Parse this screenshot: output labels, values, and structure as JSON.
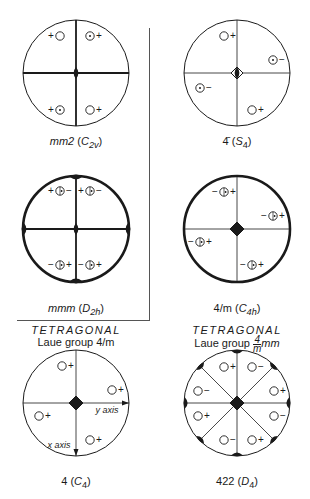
{
  "figure": {
    "panels": [
      {
        "id": "mm2",
        "symbol": "mm2",
        "schoenflies": "C",
        "schoenflies_sub": "2v",
        "center": [
          76,
          73
        ],
        "radius": 53,
        "thick_border": false,
        "mirrors": [
          "horizontal",
          "vertical"
        ],
        "axis_symbol": "2-fold (lens)",
        "poles": [
          {
            "label_left": "+",
            "marker": "open",
            "label_right": "",
            "x": 60,
            "y": 36
          },
          {
            "label_left": "",
            "marker": "dot",
            "label_right": "+",
            "x": 90,
            "y": 36
          },
          {
            "label_left": "+",
            "marker": "dot",
            "label_right": "",
            "x": 60,
            "y": 110
          },
          {
            "label_left": "",
            "marker": "open",
            "label_right": "+",
            "x": 90,
            "y": 110
          }
        ]
      },
      {
        "id": "s4",
        "symbol": "4̄",
        "schoenflies": "S",
        "schoenflies_sub": "4",
        "center": [
          237,
          73
        ],
        "radius": 53,
        "thick_border": false,
        "mirrors": [],
        "axis_symbol": "4-bar (diamond with lens)",
        "poles": [
          {
            "label_left": "",
            "marker": "open",
            "label_right": "+",
            "x": 224,
            "y": 36
          },
          {
            "label_left": "",
            "marker": "dot",
            "label_right": "−",
            "x": 273,
            "y": 60
          },
          {
            "label_left": "",
            "marker": "dot",
            "label_right": "−",
            "x": 200,
            "y": 88
          },
          {
            "label_left": "",
            "marker": "open",
            "label_right": "+",
            "x": 252,
            "y": 110
          }
        ]
      },
      {
        "id": "mmm",
        "symbol": "mmm",
        "schoenflies": "D",
        "schoenflies_sub": "2h",
        "center": [
          76,
          229
        ],
        "radius": 53,
        "thick_border": true,
        "mirrors": [
          "horizontal",
          "vertical",
          "equatorial"
        ],
        "axis_symbol": "2-fold (lens)",
        "poles": [
          {
            "label_left": "+",
            "marker": "split",
            "label_right": "−",
            "x": 60,
            "y": 191
          },
          {
            "label_left": "+",
            "marker": "split",
            "label_right": "−",
            "x": 90,
            "y": 191
          },
          {
            "label_left": "−",
            "marker": "split",
            "label_right": "+",
            "x": 60,
            "y": 265
          },
          {
            "label_left": "−",
            "marker": "split",
            "label_right": "+",
            "x": 90,
            "y": 265
          }
        ]
      },
      {
        "id": "4m",
        "symbol": "4/m",
        "schoenflies": "C",
        "schoenflies_sub": "4h",
        "center": [
          237,
          229
        ],
        "radius": 53,
        "thick_border": true,
        "mirrors": [
          "equatorial"
        ],
        "axis_symbol": "4-fold (diamond)",
        "poles": [
          {
            "label_left": "−",
            "marker": "split",
            "label_right": "+",
            "x": 224,
            "y": 192
          },
          {
            "label_left": "−",
            "marker": "split",
            "label_right": "+",
            "x": 273,
            "y": 216
          },
          {
            "label_left": "−",
            "marker": "split",
            "label_right": "+",
            "x": 200,
            "y": 242
          },
          {
            "label_left": "−",
            "marker": "split",
            "label_right": "+",
            "x": 252,
            "y": 265
          }
        ]
      },
      {
        "id": "c4",
        "symbol": "4",
        "schoenflies": "C",
        "schoenflies_sub": "4",
        "center": [
          76,
          403
        ],
        "radius": 53,
        "thick_border": false,
        "mirrors": [],
        "axis_symbol": "4-fold (diamond)",
        "axes": {
          "x_label": "x axis",
          "y_label": "y axis"
        },
        "poles": [
          {
            "label_left": "",
            "marker": "open",
            "label_right": "+",
            "x": 62,
            "y": 366
          },
          {
            "label_left": "",
            "marker": "open",
            "label_right": "+",
            "x": 112,
            "y": 390
          },
          {
            "label_left": "",
            "marker": "open",
            "label_right": "+",
            "x": 39,
            "y": 416
          },
          {
            "label_left": "",
            "marker": "open",
            "label_right": "+",
            "x": 90,
            "y": 440
          }
        ]
      },
      {
        "id": "422",
        "symbol": "422",
        "schoenflies": "D",
        "schoenflies_sub": "4",
        "center": [
          237,
          403
        ],
        "radius": 53,
        "thick_border": false,
        "mirrors": [],
        "axis_symbol": "4-fold (diamond) with 2-fold edges",
        "poles": [
          {
            "label_left": "",
            "marker": "open",
            "label_right": "+",
            "x": 224,
            "y": 367
          },
          {
            "label_left": "",
            "marker": "open",
            "label_right": "−",
            "x": 252,
            "y": 367
          },
          {
            "label_left": "",
            "marker": "open",
            "label_right": "−",
            "x": 198,
            "y": 391
          },
          {
            "label_left": "",
            "marker": "open",
            "label_right": "+",
            "x": 274,
            "y": 391
          },
          {
            "label_left": "",
            "marker": "open",
            "label_right": "+",
            "x": 198,
            "y": 416
          },
          {
            "label_left": "",
            "marker": "open",
            "label_right": "−",
            "x": 274,
            "y": 416
          },
          {
            "label_left": "",
            "marker": "open",
            "label_right": "−",
            "x": 224,
            "y": 440
          },
          {
            "label_left": "",
            "marker": "open",
            "label_right": "+",
            "x": 252,
            "y": 440
          }
        ]
      }
    ],
    "captions": {
      "mm2": {
        "main": "mm2",
        "open": "(",
        "sym": "C",
        "sub": "2v",
        "close": ")"
      },
      "s4": {
        "main": "4̄",
        "open": "(",
        "sym": "S",
        "sub": "4",
        "close": ")"
      },
      "mmm": {
        "main": "mmm",
        "open": "(",
        "sym": "D",
        "sub": "2h",
        "close": ")"
      },
      "4m": {
        "main": "4/m",
        "open": "(",
        "sym": "C",
        "sub": "4h",
        "close": ")"
      },
      "c4": {
        "main": "4",
        "open": "(",
        "sym": "C",
        "sub": "4",
        "close": ")"
      },
      "422": {
        "main": "422",
        "open": "(",
        "sym": "D",
        "sub": "4",
        "close": ")"
      }
    },
    "headings": {
      "left": {
        "title": "TETRAGONAL",
        "subtitle": "Laue group 4/m"
      },
      "right": {
        "title": "TETRAGONAL",
        "subtitle_prefix": "Laue group ",
        "frac_num": "4",
        "frac_den": "m",
        "subtitle_suffix": "mm"
      }
    }
  }
}
